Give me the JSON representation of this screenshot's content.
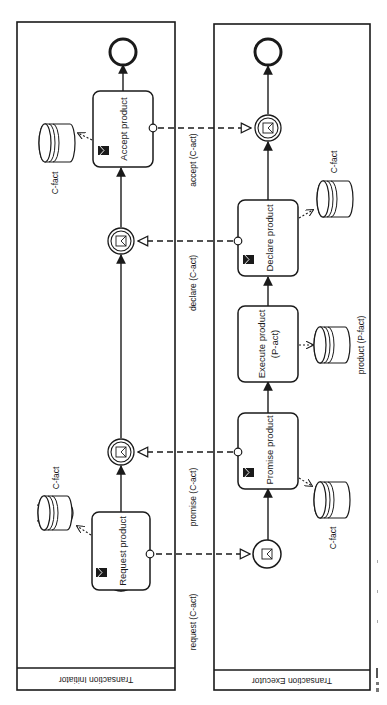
{
  "diagram": {
    "type": "BPMN collaboration (rotated 90°)",
    "orientation": "rotated clockwise, text reads bottom-to-top",
    "colors": {
      "stroke": "#1a1a1a",
      "background": "#ffffff"
    },
    "pools": [
      {
        "id": "initiator",
        "label": "Transaction Initiator",
        "elements": {
          "start_event": "start",
          "request_task": "Request product",
          "promise_catch": "message-intermediate-catch",
          "declare_catch": "message-intermediate-catch",
          "accept_task": "Accept product",
          "end_event": "end"
        },
        "data_stores": [
          {
            "label": "C-fact",
            "linked_to": "Request product"
          },
          {
            "label": "C-fact",
            "linked_to": "Accept product"
          }
        ]
      },
      {
        "id": "executor",
        "label": "Transaction Executor",
        "elements": {
          "request_catch": "message-start",
          "promise_task": "Promise product",
          "execute_task_line1": "Execute product",
          "execute_task_line2": "(P-act)",
          "declare_task": "Declare product",
          "accept_catch": "message-intermediate-catch",
          "end_event": "end"
        },
        "data_stores": [
          {
            "label": "C-fact",
            "linked_to": "Promise product"
          },
          {
            "label": "product (P-fact)",
            "linked_to": "Execute product (P-act)"
          },
          {
            "label": "C-fact",
            "linked_to": "Declare product"
          }
        ]
      }
    ],
    "message_flows": [
      {
        "label": "request (C-act)",
        "from": "Request product",
        "to": "executor message start"
      },
      {
        "label": "promise (C-act)",
        "from": "Promise product",
        "to": "initiator catch 1"
      },
      {
        "label": "declare (C-act)",
        "from": "Declare product",
        "to": "initiator catch 2"
      },
      {
        "label": "accept (C-act)",
        "from": "Accept product",
        "to": "executor catch"
      }
    ]
  },
  "labels": {
    "pool_initiator": "Transaction Initiator",
    "pool_executor": "Transaction Executor",
    "request_task": "Request product",
    "accept_task": "Accept product",
    "promise_task": "Promise product",
    "execute_task_1": "Execute product",
    "execute_task_2": "(P-act)",
    "declare_task": "Declare product",
    "store_c_fact": "C-fact",
    "store_p_fact": "product (P-fact)",
    "msg_request": "request (C-act)",
    "msg_promise": "promise (C-act)",
    "msg_declare": "declare (C-act)",
    "msg_accept": "accept (C-act)"
  }
}
